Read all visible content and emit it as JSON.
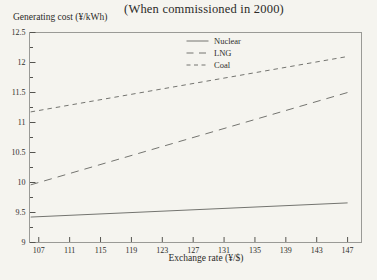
{
  "window": {
    "background": "#f5f4ef"
  },
  "chart_data": {
    "type": "line",
    "title": "(When commissioned in 2000)",
    "ylabel": "Generating cost (¥/kWh)",
    "xlabel": "Exchange rate (¥/$)",
    "xlim": [
      105.8,
      148.8
    ],
    "ylim": [
      9,
      12.5
    ],
    "x_ticks": [
      107,
      111,
      115,
      119,
      123,
      127,
      131,
      135,
      139,
      143,
      147
    ],
    "y_ticks": [
      9,
      9.5,
      10,
      10.5,
      11,
      11.5,
      12,
      12.5
    ],
    "grid": false,
    "legend_position": "top-center-inside",
    "legend_entries": [
      "Nuclear",
      "LNG",
      "Coal"
    ],
    "series": [
      {
        "name": "Nuclear",
        "dash": "solid",
        "x": [
          107,
          147
        ],
        "values": [
          9.43,
          9.66
        ]
      },
      {
        "name": "LNG",
        "dash": "long-dash",
        "x": [
          107,
          147
        ],
        "values": [
          10.0,
          11.5
        ]
      },
      {
        "name": "Coal",
        "dash": "short-dash",
        "x": [
          107,
          147
        ],
        "values": [
          11.2,
          12.1
        ]
      }
    ],
    "line_color": "#747470",
    "frame_color": "#9a9a96",
    "tick_color": "#55544f",
    "text_color": "#2f2e2a"
  }
}
